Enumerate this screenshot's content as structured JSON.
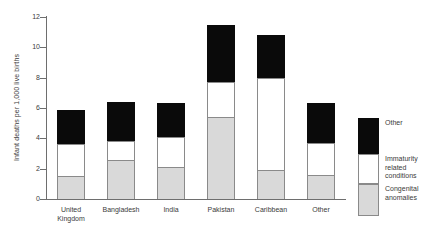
{
  "chart_data": {
    "type": "bar",
    "stacked": true,
    "title": "",
    "subtitle": "",
    "xlabel": "",
    "ylabel": "Infant deaths per 1,000 live births",
    "ylim": [
      0,
      12
    ],
    "yticks": [
      0,
      2,
      4,
      6,
      8,
      10,
      12
    ],
    "grid": false,
    "legend_position": "right",
    "categories": [
      "United Kingdom",
      "Bangladesh",
      "India",
      "Pakistan",
      "Caribbean",
      "Other"
    ],
    "category_lines": [
      [
        "United",
        "Kingdom"
      ],
      [
        "Bangladesh"
      ],
      [
        "India"
      ],
      [
        "Pakistan"
      ],
      [
        "Caribbean"
      ],
      [
        "Other"
      ]
    ],
    "series": [
      {
        "name": "Congenital anomalies",
        "legend_lines": [
          "Congenital",
          "anomalies"
        ],
        "color": "#d9d9d9",
        "values": [
          1.5,
          2.6,
          2.1,
          5.4,
          1.9,
          1.6
        ]
      },
      {
        "name": "Immaturity related conditions",
        "legend_lines": [
          "Immaturity",
          "related",
          "conditions"
        ],
        "color": "#ffffff",
        "values": [
          2.1,
          1.2,
          2.0,
          2.3,
          6.1,
          2.1
        ]
      },
      {
        "name": "Other",
        "legend_lines": [
          "Other"
        ],
        "color": "#0a0a0a",
        "values": [
          2.3,
          2.6,
          2.2,
          3.8,
          2.8,
          2.6
        ]
      }
    ],
    "totals": [
      5.9,
      6.4,
      6.3,
      11.5,
      10.8,
      6.3
    ],
    "annotations": []
  },
  "footnote": {
    "text": ""
  }
}
